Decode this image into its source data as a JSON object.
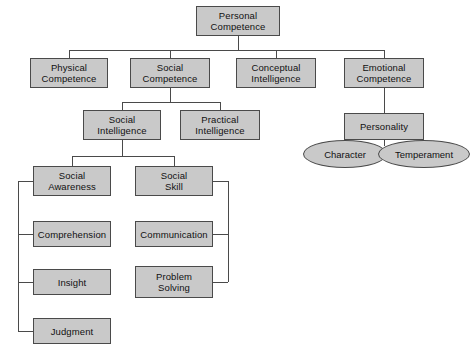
{
  "diagram": {
    "colors": {
      "node_fill": "#c9c9c9",
      "node_border": "#4a4a4a",
      "connector": "#4a4a4a",
      "background": "#ffffff",
      "text": "#111111"
    },
    "nodes": [
      {
        "id": "personal-competence",
        "label": "Personal\nCompetence",
        "shape": "box",
        "x": 196,
        "y": 6,
        "w": 84,
        "h": 30
      },
      {
        "id": "physical-competence",
        "label": "Physical\nCompetence",
        "shape": "box",
        "x": 30,
        "y": 58,
        "w": 78,
        "h": 30
      },
      {
        "id": "social-competence",
        "label": "Social\nCompetence",
        "shape": "box",
        "x": 130,
        "y": 58,
        "w": 80,
        "h": 30
      },
      {
        "id": "conceptual-intelligence",
        "label": "Conceptual\nIntelligence",
        "shape": "box",
        "x": 236,
        "y": 58,
        "w": 80,
        "h": 30
      },
      {
        "id": "emotional-competence",
        "label": "Emotional\nCompetence",
        "shape": "box",
        "x": 344,
        "y": 58,
        "w": 80,
        "h": 30
      },
      {
        "id": "social-intelligence",
        "label": "Social\nIntelligence",
        "shape": "box",
        "x": 83,
        "y": 110,
        "w": 78,
        "h": 30
      },
      {
        "id": "practical-intelligence",
        "label": "Practical\nIntelligence",
        "shape": "box",
        "x": 180,
        "y": 110,
        "w": 80,
        "h": 30
      },
      {
        "id": "personality",
        "label": "Personality",
        "shape": "box",
        "x": 344,
        "y": 113,
        "w": 80,
        "h": 27
      },
      {
        "id": "social-awareness",
        "label": "Social\nAwareness",
        "shape": "box",
        "x": 33,
        "y": 166,
        "w": 78,
        "h": 30
      },
      {
        "id": "social-skill",
        "label": "Social\nSkill",
        "shape": "box",
        "x": 135,
        "y": 166,
        "w": 78,
        "h": 30
      },
      {
        "id": "comprehension",
        "label": "Comprehension",
        "shape": "box",
        "x": 33,
        "y": 221,
        "w": 78,
        "h": 26
      },
      {
        "id": "communication",
        "label": "Communication",
        "shape": "box",
        "x": 135,
        "y": 221,
        "w": 78,
        "h": 26
      },
      {
        "id": "insight",
        "label": "Insight",
        "shape": "box",
        "x": 33,
        "y": 269,
        "w": 78,
        "h": 26
      },
      {
        "id": "problem-solving",
        "label": "Problem\nSolving",
        "shape": "box",
        "x": 135,
        "y": 266,
        "w": 78,
        "h": 32
      },
      {
        "id": "judgment",
        "label": "Judgment",
        "shape": "box",
        "x": 33,
        "y": 318,
        "w": 78,
        "h": 26
      },
      {
        "id": "character",
        "label": "Character",
        "shape": "ellipse",
        "x": 303,
        "y": 140,
        "w": 84,
        "h": 28
      },
      {
        "id": "temperament",
        "label": "Temperament",
        "shape": "ellipse",
        "x": 378,
        "y": 140,
        "w": 92,
        "h": 28
      }
    ],
    "connectors": [
      {
        "id": "trunk-root-down",
        "type": "v",
        "x": 238,
        "y": 36,
        "len": 14
      },
      {
        "id": "row1-bus",
        "type": "h",
        "x": 69,
        "y": 50,
        "len": 315
      },
      {
        "id": "drop-physical",
        "type": "v",
        "x": 69,
        "y": 50,
        "len": 8
      },
      {
        "id": "drop-social",
        "type": "v",
        "x": 170,
        "y": 50,
        "len": 8
      },
      {
        "id": "drop-conceptual",
        "type": "v",
        "x": 276,
        "y": 50,
        "len": 8
      },
      {
        "id": "drop-emotional",
        "type": "v",
        "x": 384,
        "y": 50,
        "len": 8
      },
      {
        "id": "social-down",
        "type": "v",
        "x": 170,
        "y": 88,
        "len": 14
      },
      {
        "id": "row2-bus",
        "type": "h",
        "x": 122,
        "y": 102,
        "len": 98
      },
      {
        "id": "drop-socint",
        "type": "v",
        "x": 122,
        "y": 102,
        "len": 8
      },
      {
        "id": "drop-pracint",
        "type": "v",
        "x": 220,
        "y": 102,
        "len": 8
      },
      {
        "id": "emotional-down",
        "type": "v",
        "x": 384,
        "y": 88,
        "len": 25
      },
      {
        "id": "personality-down",
        "type": "v",
        "x": 384,
        "y": 140,
        "len": 6
      },
      {
        "id": "socint-down",
        "type": "v",
        "x": 122,
        "y": 140,
        "len": 16
      },
      {
        "id": "row3-bus",
        "type": "h",
        "x": 72,
        "y": 156,
        "len": 102
      },
      {
        "id": "drop-awareness",
        "type": "v",
        "x": 72,
        "y": 156,
        "len": 10
      },
      {
        "id": "drop-skill",
        "type": "v",
        "x": 174,
        "y": 156,
        "len": 10
      },
      {
        "id": "left-bracket",
        "type": "v",
        "x": 18,
        "y": 181,
        "len": 150
      },
      {
        "id": "stub-awareness",
        "type": "h",
        "x": 18,
        "y": 181,
        "len": 15
      },
      {
        "id": "stub-comprehension",
        "type": "h",
        "x": 18,
        "y": 234,
        "len": 15
      },
      {
        "id": "stub-insight",
        "type": "h",
        "x": 18,
        "y": 282,
        "len": 15
      },
      {
        "id": "stub-judgment",
        "type": "h",
        "x": 18,
        "y": 331,
        "len": 15
      },
      {
        "id": "right-bracket",
        "type": "v",
        "x": 228,
        "y": 181,
        "len": 101
      },
      {
        "id": "stub-skill",
        "type": "h",
        "x": 213,
        "y": 181,
        "len": 15
      },
      {
        "id": "stub-communication",
        "type": "h",
        "x": 213,
        "y": 234,
        "len": 15
      },
      {
        "id": "stub-problem",
        "type": "h",
        "x": 213,
        "y": 282,
        "len": 15
      }
    ]
  }
}
